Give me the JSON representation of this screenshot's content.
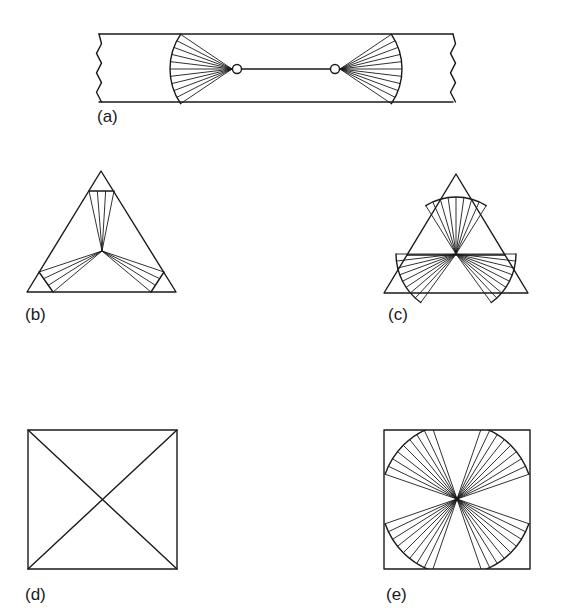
{
  "colors": {
    "ink": "#1a1a1a",
    "paper": "#ffffff"
  },
  "panels": [
    {
      "id": "a",
      "label": "(a)",
      "label_pos": [
        97,
        108
      ],
      "shape": "strip",
      "strip": {
        "x_left": 99,
        "x_right": 453,
        "y_top": 34,
        "y_bottom": 102,
        "wavy_left": true,
        "wavy_right": true
      },
      "nodes": [
        {
          "cx": 237,
          "cy": 69,
          "r": 4.5
        },
        {
          "cx": 335,
          "cy": 69,
          "r": 4.5
        }
      ],
      "connector": {
        "x1": 241.5,
        "y1": 69,
        "x2": 330.5,
        "y2": 69
      },
      "fans": [
        {
          "cx": 232,
          "cy": 69,
          "r": 62,
          "dir_deg": 180,
          "half_angle_deg": 34,
          "spokes": 11,
          "cap": "arc"
        },
        {
          "cx": 340,
          "cy": 69,
          "r": 62,
          "dir_deg": 0,
          "half_angle_deg": 34,
          "spokes": 11,
          "cap": "arc"
        }
      ]
    },
    {
      "id": "b",
      "label": "(b)",
      "label_pos": [
        25,
        306
      ],
      "shape": "triangle",
      "triangle": [
        [
          101,
          171
        ],
        [
          27,
          292
        ],
        [
          176,
          292
        ]
      ],
      "center": [
        102,
        251
      ],
      "fans": [
        {
          "cap": "chord",
          "chord": [
            [
              89,
              191
            ],
            [
              114,
              191
            ]
          ],
          "spokes": 4
        },
        {
          "cap": "chord",
          "chord": [
            [
              39,
              272
            ],
            [
              53,
              292
            ]
          ],
          "spokes": 4
        },
        {
          "cap": "chord",
          "chord": [
            [
              164,
              272
            ],
            [
              151,
              292
            ]
          ],
          "spokes": 4
        }
      ]
    },
    {
      "id": "c",
      "label": "(c)",
      "label_pos": [
        388,
        306
      ],
      "shape": "triangle",
      "triangle": [
        [
          456,
          174
        ],
        [
          384,
          293
        ],
        [
          528,
          293
        ]
      ],
      "center": [
        456,
        254
      ],
      "crossbar": {
        "x1": 407,
        "y1": 255,
        "x2": 505,
        "y2": 255
      },
      "fans": [
        {
          "r": 57,
          "dir_deg": 270,
          "half_angle_deg": 32,
          "spokes": 9,
          "cap": "arc"
        },
        {
          "r": 60,
          "dir_deg": 153,
          "half_angle_deg": 27,
          "spokes": 9,
          "cap": "arc"
        },
        {
          "r": 60,
          "dir_deg": 27,
          "half_angle_deg": 27,
          "spokes": 9,
          "cap": "arc"
        }
      ]
    },
    {
      "id": "d",
      "label": "(d)",
      "label_pos": [
        25,
        586
      ],
      "shape": "square",
      "square": {
        "x": 28,
        "y": 430,
        "w": 149,
        "h": 139
      },
      "diagonals": true
    },
    {
      "id": "e",
      "label": "(e)",
      "label_pos": [
        386,
        586
      ],
      "shape": "square",
      "square": {
        "x": 384,
        "y": 430,
        "w": 146,
        "h": 139
      },
      "center": [
        457,
        499
      ],
      "fans": [
        {
          "r": 76,
          "dir_deg": 225,
          "half_angle_deg": 26,
          "spokes": 9,
          "cap": "arc"
        },
        {
          "r": 76,
          "dir_deg": 315,
          "half_angle_deg": 26,
          "spokes": 9,
          "cap": "arc"
        },
        {
          "r": 76,
          "dir_deg": 135,
          "half_angle_deg": 26,
          "spokes": 9,
          "cap": "arc"
        },
        {
          "r": 76,
          "dir_deg": 45,
          "half_angle_deg": 26,
          "spokes": 9,
          "cap": "arc"
        }
      ]
    }
  ]
}
